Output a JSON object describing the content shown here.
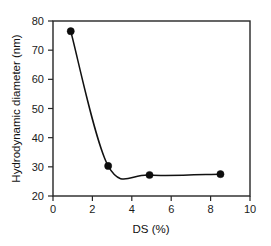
{
  "chart_data": {
    "type": "line",
    "title": "",
    "xlabel": "DS (%)",
    "ylabel": "Hydrodynamic diameter (nm)",
    "xlim": [
      0,
      10
    ],
    "ylim": [
      20,
      80
    ],
    "xticks": [
      0,
      2,
      4,
      6,
      8,
      10
    ],
    "yticks": [
      20,
      30,
      40,
      50,
      60,
      70,
      80
    ],
    "xtick_labels": [
      "0",
      "2",
      "4",
      "6",
      "8",
      "10"
    ],
    "ytick_labels": [
      "20",
      "30",
      "40",
      "50",
      "60",
      "70",
      "80"
    ],
    "grid": false,
    "legend": null,
    "marker": "filled-circle",
    "marker_color": "#0d0d0d",
    "line_color": "#111111",
    "background": "#ffffff",
    "frame": "full-box",
    "series": [
      {
        "name": "Hydrodynamic diameter",
        "x": [
          0.9,
          2.8,
          4.9,
          8.5
        ],
        "values": [
          76.5,
          30.3,
          27.2,
          27.5
        ]
      }
    ],
    "annotations": []
  },
  "axes": {
    "x_title": "DS (%)",
    "y_title": "Hydrodynamic diameter (nm)"
  }
}
